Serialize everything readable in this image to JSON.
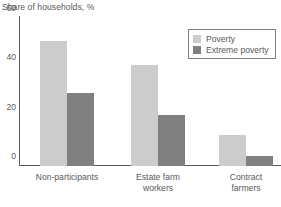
{
  "chart_data": {
    "type": "bar",
    "title": "Share of households, %",
    "xlabel": "",
    "ylabel": "Share of households, %",
    "ylim": [
      0,
      60
    ],
    "yticks": [
      0,
      20,
      40,
      60
    ],
    "ytick_labels": [
      "0",
      "20",
      "40",
      "60"
    ],
    "grid": false,
    "legend_position": "top-right",
    "categories": [
      "Non-participants",
      "Estate farm\nworkers",
      "Contract\nfarmers"
    ],
    "series": [
      {
        "name": "Poverty",
        "color": "#cccccc",
        "values": [
          50.5,
          41,
          12.5
        ]
      },
      {
        "name": "Extreme poverty",
        "color": "#808080",
        "values": [
          29.5,
          20.5,
          4
        ]
      }
    ]
  },
  "legend": {
    "items": [
      {
        "label": "Poverty",
        "color": "#cccccc"
      },
      {
        "label": "Extreme poverty",
        "color": "#808080"
      }
    ]
  },
  "colors": {
    "poverty": "#cccccc",
    "extreme_poverty": "#808080",
    "axis": "#58595b",
    "text": "#58595b",
    "background": "#ffffff"
  }
}
